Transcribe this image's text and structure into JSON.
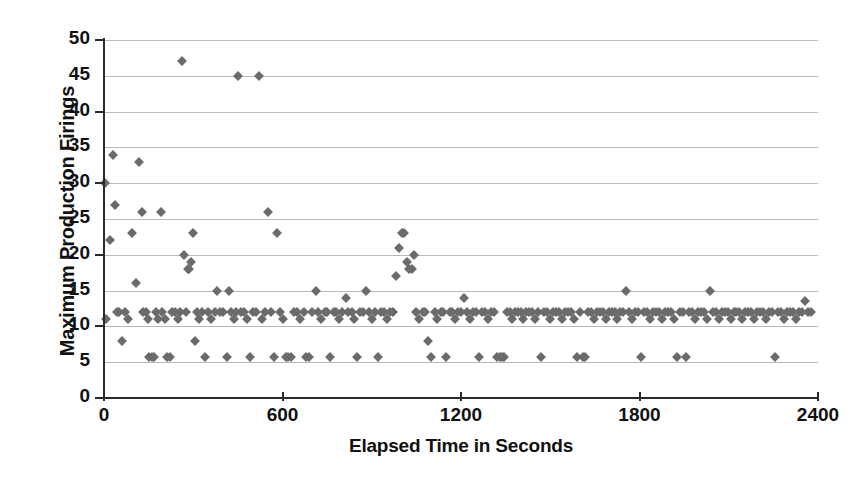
{
  "chart_data": {
    "type": "scatter",
    "title": "",
    "xlabel": "Elapsed Time in Seconds",
    "ylabel": "Maximum Production Firings",
    "xlim": [
      0,
      2400
    ],
    "ylim": [
      0,
      50
    ],
    "xticks": [
      0,
      600,
      1200,
      1800,
      2400
    ],
    "yticks": [
      0,
      5,
      10,
      15,
      20,
      25,
      30,
      35,
      40,
      45,
      50
    ],
    "grid": true,
    "legend": "none",
    "marker": "diamond",
    "marker_color": "#6b6b6b",
    "series": [
      {
        "name": "Maximum Production Firings",
        "points": [
          [
            5,
            30
          ],
          [
            8,
            11
          ],
          [
            20,
            22
          ],
          [
            30,
            34
          ],
          [
            38,
            27
          ],
          [
            45,
            12
          ],
          [
            52,
            12
          ],
          [
            62,
            8
          ],
          [
            72,
            12
          ],
          [
            80,
            11
          ],
          [
            95,
            23
          ],
          [
            108,
            16
          ],
          [
            118,
            33
          ],
          [
            128,
            26
          ],
          [
            132,
            12
          ],
          [
            140,
            12
          ],
          [
            148,
            11
          ],
          [
            152,
            5.7
          ],
          [
            160,
            5.7
          ],
          [
            168,
            5.7
          ],
          [
            175,
            12
          ],
          [
            182,
            11
          ],
          [
            190,
            26
          ],
          [
            196,
            12
          ],
          [
            205,
            11
          ],
          [
            212,
            5.7
          ],
          [
            222,
            5.7
          ],
          [
            228,
            12
          ],
          [
            240,
            12
          ],
          [
            248,
            11
          ],
          [
            255,
            12
          ],
          [
            262,
            47
          ],
          [
            270,
            20
          ],
          [
            276,
            12
          ],
          [
            282,
            18
          ],
          [
            286,
            18
          ],
          [
            292,
            19
          ],
          [
            298,
            23
          ],
          [
            305,
            8
          ],
          [
            312,
            12
          ],
          [
            320,
            11
          ],
          [
            330,
            12
          ],
          [
            338,
            5.7
          ],
          [
            350,
            12
          ],
          [
            360,
            11
          ],
          [
            372,
            12
          ],
          [
            380,
            15
          ],
          [
            390,
            12
          ],
          [
            400,
            12
          ],
          [
            412,
            5.7
          ],
          [
            420,
            15
          ],
          [
            428,
            12
          ],
          [
            436,
            11
          ],
          [
            444,
            12
          ],
          [
            452,
            45
          ],
          [
            460,
            12
          ],
          [
            470,
            12
          ],
          [
            480,
            11
          ],
          [
            490,
            5.7
          ],
          [
            500,
            12
          ],
          [
            512,
            12
          ],
          [
            520,
            45
          ],
          [
            530,
            11
          ],
          [
            540,
            12
          ],
          [
            550,
            26
          ],
          [
            560,
            12
          ],
          [
            570,
            5.7
          ],
          [
            580,
            23
          ],
          [
            590,
            12
          ],
          [
            600,
            11
          ],
          [
            612,
            5.7
          ],
          [
            620,
            5.7
          ],
          [
            628,
            5.7
          ],
          [
            640,
            12
          ],
          [
            650,
            12
          ],
          [
            660,
            11
          ],
          [
            672,
            12
          ],
          [
            680,
            5.7
          ],
          [
            690,
            5.7
          ],
          [
            700,
            12
          ],
          [
            712,
            15
          ],
          [
            720,
            12
          ],
          [
            730,
            11
          ],
          [
            742,
            12
          ],
          [
            750,
            12
          ],
          [
            760,
            5.7
          ],
          [
            772,
            12
          ],
          [
            780,
            12
          ],
          [
            790,
            11
          ],
          [
            800,
            12
          ],
          [
            812,
            14
          ],
          [
            820,
            12
          ],
          [
            832,
            12
          ],
          [
            840,
            11
          ],
          [
            850,
            5.7
          ],
          [
            860,
            12
          ],
          [
            872,
            12
          ],
          [
            880,
            15
          ],
          [
            890,
            12
          ],
          [
            900,
            11
          ],
          [
            912,
            12
          ],
          [
            920,
            5.7
          ],
          [
            930,
            12
          ],
          [
            942,
            12
          ],
          [
            950,
            11
          ],
          [
            960,
            12
          ],
          [
            972,
            12
          ],
          [
            980,
            17
          ],
          [
            990,
            21
          ],
          [
            1000,
            23
          ],
          [
            1010,
            23
          ],
          [
            1018,
            19
          ],
          [
            1026,
            18
          ],
          [
            1034,
            18
          ],
          [
            1042,
            20
          ],
          [
            1050,
            12
          ],
          [
            1060,
            11
          ],
          [
            1072,
            12
          ],
          [
            1080,
            12
          ],
          [
            1090,
            8
          ],
          [
            1100,
            5.7
          ],
          [
            1112,
            12
          ],
          [
            1120,
            11
          ],
          [
            1132,
            12
          ],
          [
            1140,
            12
          ],
          [
            1150,
            5.7
          ],
          [
            1162,
            12
          ],
          [
            1170,
            12
          ],
          [
            1180,
            11
          ],
          [
            1190,
            12
          ],
          [
            1200,
            12
          ],
          [
            1210,
            14
          ],
          [
            1220,
            12
          ],
          [
            1230,
            11
          ],
          [
            1240,
            12
          ],
          [
            1250,
            12
          ],
          [
            1262,
            5.7
          ],
          [
            1270,
            12
          ],
          [
            1280,
            12
          ],
          [
            1290,
            11
          ],
          [
            1300,
            12
          ],
          [
            1312,
            12
          ],
          [
            1320,
            5.7
          ],
          [
            1330,
            5.7
          ],
          [
            1338,
            5.7
          ],
          [
            1346,
            5.7
          ],
          [
            1356,
            12
          ],
          [
            1364,
            12
          ],
          [
            1372,
            11
          ],
          [
            1380,
            12
          ],
          [
            1390,
            12
          ],
          [
            1400,
            12
          ],
          [
            1410,
            11
          ],
          [
            1420,
            12
          ],
          [
            1430,
            12
          ],
          [
            1440,
            12
          ],
          [
            1450,
            11
          ],
          [
            1460,
            12
          ],
          [
            1470,
            5.7
          ],
          [
            1480,
            12
          ],
          [
            1490,
            12
          ],
          [
            1500,
            11
          ],
          [
            1510,
            12
          ],
          [
            1520,
            12
          ],
          [
            1530,
            12
          ],
          [
            1540,
            11
          ],
          [
            1550,
            12
          ],
          [
            1560,
            12
          ],
          [
            1570,
            12
          ],
          [
            1580,
            11
          ],
          [
            1590,
            5.7
          ],
          [
            1600,
            12
          ],
          [
            1610,
            5.7
          ],
          [
            1618,
            5.7
          ],
          [
            1628,
            12
          ],
          [
            1636,
            12
          ],
          [
            1646,
            11
          ],
          [
            1656,
            12
          ],
          [
            1666,
            12
          ],
          [
            1676,
            12
          ],
          [
            1686,
            11
          ],
          [
            1696,
            12
          ],
          [
            1706,
            12
          ],
          [
            1716,
            12
          ],
          [
            1726,
            11
          ],
          [
            1736,
            12
          ],
          [
            1746,
            12
          ],
          [
            1756,
            15
          ],
          [
            1766,
            12
          ],
          [
            1776,
            11
          ],
          [
            1786,
            12
          ],
          [
            1796,
            12
          ],
          [
            1806,
            5.7
          ],
          [
            1816,
            12
          ],
          [
            1826,
            12
          ],
          [
            1836,
            11
          ],
          [
            1846,
            12
          ],
          [
            1856,
            12
          ],
          [
            1866,
            12
          ],
          [
            1876,
            11
          ],
          [
            1886,
            12
          ],
          [
            1896,
            12
          ],
          [
            1906,
            12
          ],
          [
            1916,
            11
          ],
          [
            1926,
            5.7
          ],
          [
            1936,
            12
          ],
          [
            1946,
            12
          ],
          [
            1956,
            5.7
          ],
          [
            1966,
            12
          ],
          [
            1976,
            12
          ],
          [
            1986,
            11
          ],
          [
            1996,
            12
          ],
          [
            2006,
            12
          ],
          [
            2016,
            12
          ],
          [
            2026,
            11
          ],
          [
            2036,
            15
          ],
          [
            2046,
            12
          ],
          [
            2056,
            12
          ],
          [
            2066,
            11
          ],
          [
            2076,
            12
          ],
          [
            2086,
            12
          ],
          [
            2096,
            12
          ],
          [
            2106,
            11
          ],
          [
            2116,
            12
          ],
          [
            2126,
            12
          ],
          [
            2136,
            12
          ],
          [
            2146,
            11
          ],
          [
            2156,
            12
          ],
          [
            2166,
            12
          ],
          [
            2176,
            12
          ],
          [
            2186,
            11
          ],
          [
            2196,
            12
          ],
          [
            2206,
            12
          ],
          [
            2216,
            12
          ],
          [
            2226,
            11
          ],
          [
            2236,
            12
          ],
          [
            2246,
            12
          ],
          [
            2256,
            5.7
          ],
          [
            2266,
            12
          ],
          [
            2276,
            12
          ],
          [
            2286,
            11
          ],
          [
            2296,
            12
          ],
          [
            2306,
            12
          ],
          [
            2316,
            12
          ],
          [
            2326,
            11
          ],
          [
            2336,
            12
          ],
          [
            2346,
            12
          ],
          [
            2356,
            13.5
          ],
          [
            2366,
            12
          ],
          [
            2376,
            12
          ]
        ]
      }
    ]
  }
}
